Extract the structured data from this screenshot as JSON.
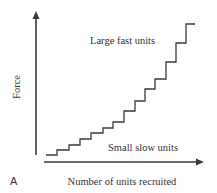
{
  "figure": {
    "panel_label": "A",
    "y_axis_label": "Force",
    "x_axis_label": "Number of units recruited",
    "annotation_top": "Large fast units",
    "annotation_bottom": "Small slow units",
    "line_color": "#3a3a3a",
    "text_color": "#333333"
  },
  "chart_data": {
    "type": "line",
    "subtype": "staircase",
    "title": "",
    "xlabel": "Number of units recruited",
    "ylabel": "Force",
    "ticks": "none",
    "grid": false,
    "annotations": [
      "Large fast units",
      "Small slow units"
    ],
    "steps": [
      {
        "unit": 1,
        "force_increment": 0.04
      },
      {
        "unit": 2,
        "force_increment": 0.04
      },
      {
        "unit": 3,
        "force_increment": 0.04
      },
      {
        "unit": 4,
        "force_increment": 0.045
      },
      {
        "unit": 5,
        "force_increment": 0.045
      },
      {
        "unit": 6,
        "force_increment": 0.04
      },
      {
        "unit": 7,
        "force_increment": 0.045
      },
      {
        "unit": 8,
        "force_increment": 0.085
      },
      {
        "unit": 9,
        "force_increment": 0.075
      },
      {
        "unit": 10,
        "force_increment": 0.09
      },
      {
        "unit": 11,
        "force_increment": 0.075
      },
      {
        "unit": 12,
        "force_increment": 0.13
      },
      {
        "unit": 13,
        "force_increment": 0.145
      },
      {
        "unit": 14,
        "force_increment": 0.145
      }
    ],
    "path_px": [
      [
        46,
        155
      ],
      [
        57,
        155
      ],
      [
        57,
        150
      ],
      [
        69,
        150
      ],
      [
        69,
        145
      ],
      [
        80,
        145
      ],
      [
        80,
        139
      ],
      [
        91,
        139
      ],
      [
        91,
        133
      ],
      [
        103,
        133
      ],
      [
        103,
        128
      ],
      [
        113,
        128
      ],
      [
        113,
        122
      ],
      [
        124,
        122
      ],
      [
        124,
        111
      ],
      [
        135,
        111
      ],
      [
        135,
        101
      ],
      [
        145,
        101
      ],
      [
        145,
        89
      ],
      [
        155,
        89
      ],
      [
        155,
        79
      ],
      [
        166,
        79
      ],
      [
        166,
        62
      ],
      [
        176,
        62
      ],
      [
        176,
        43
      ],
      [
        186,
        43
      ],
      [
        186,
        24
      ],
      [
        195,
        24
      ]
    ]
  }
}
